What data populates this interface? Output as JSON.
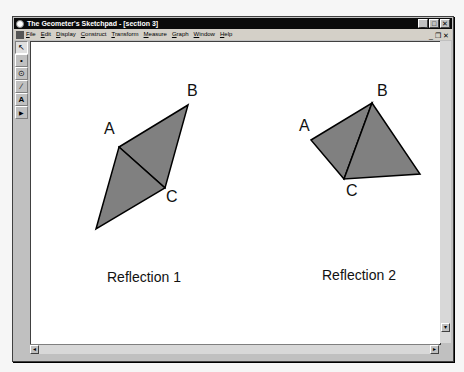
{
  "window": {
    "title": "The Geometer's Sketchpad - [section 3]",
    "controls": {
      "minimize": "_",
      "maximize": "□",
      "close": "✕"
    }
  },
  "menubar": {
    "items": [
      "File",
      "Edit",
      "Display",
      "Construct",
      "Transform",
      "Measure",
      "Graph",
      "Window",
      "Help"
    ],
    "mdi_controls": {
      "minimize": "_",
      "restore": "❐",
      "close": "✕"
    }
  },
  "toolbox": {
    "tools": [
      {
        "name": "selection-arrow-tool",
        "glyph": "↖"
      },
      {
        "name": "point-tool",
        "glyph": "•"
      },
      {
        "name": "compass-tool",
        "glyph": "⊙"
      },
      {
        "name": "straightedge-tool",
        "glyph": "∕"
      },
      {
        "name": "text-tool",
        "glyph": "A"
      },
      {
        "name": "custom-tool",
        "glyph": "▶"
      }
    ]
  },
  "sketch": {
    "fill_color": "#808080",
    "stroke_color": "#000000",
    "figure1": {
      "caption": "Reflection 1",
      "labels": {
        "A": "A",
        "B": "B",
        "C": "C"
      }
    },
    "figure2": {
      "caption": "Reflection 2",
      "labels": {
        "A": "A",
        "B": "B",
        "C": "C"
      }
    }
  },
  "scrollbars": {
    "left_arrow": "◂",
    "right_arrow": "▸",
    "up_arrow": "▴",
    "down_arrow": "▾"
  }
}
